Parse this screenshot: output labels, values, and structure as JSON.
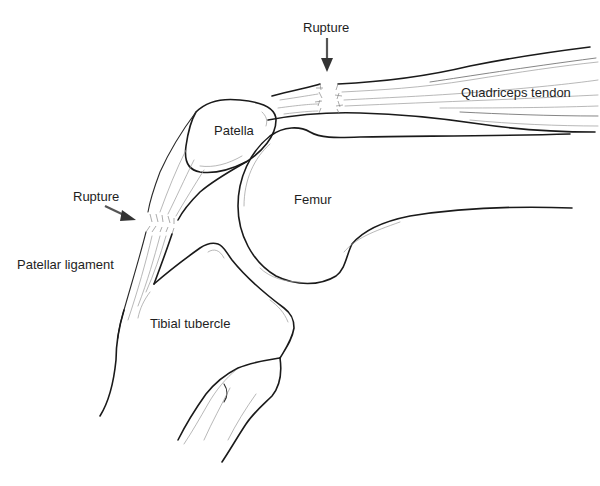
{
  "figure": {
    "labels": {
      "rupture_top": "Rupture",
      "rupture_left": "Rupture",
      "quadriceps_tendon": "Quadriceps tendon",
      "patella": "Patella",
      "femur": "Femur",
      "patellar_ligament": "Patellar ligament",
      "tibial_tubercle": "Tibial tubercle"
    },
    "arrows": [
      {
        "name": "rupture-arrow-quadriceps",
        "direction": "down",
        "target": "quadriceps tendon"
      },
      {
        "name": "rupture-arrow-patellar",
        "direction": "down-right",
        "target": "patellar ligament"
      }
    ],
    "colors": {
      "background": "#ffffff",
      "line": "#1a1a1a",
      "fiber": "#9a9a9a",
      "arrow": "#444444",
      "text": "#1e1e1e"
    }
  }
}
